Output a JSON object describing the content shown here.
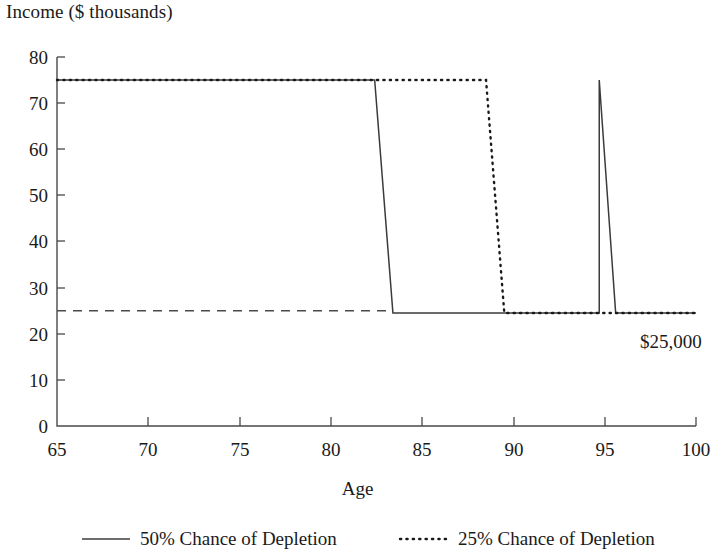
{
  "chart_data": {
    "type": "line",
    "title": "Income ($ thousands)",
    "xlabel": "Age",
    "ylabel": "Income ($ thousands)",
    "xlim": [
      65,
      100
    ],
    "ylim": [
      0,
      80
    ],
    "xticks": [
      "65",
      "70",
      "75",
      "80",
      "85",
      "90",
      "95",
      "100"
    ],
    "yticks": [
      "80",
      "70",
      "60",
      "50",
      "40",
      "30",
      "20",
      "10",
      "0"
    ],
    "grid": false,
    "legend_position": "bottom",
    "annotations": [
      {
        "text": "$25,000",
        "x": 99.5,
        "y": 21.5
      }
    ],
    "series": [
      {
        "name": "50% Chance of Depletion",
        "style": "solid",
        "color": "#3b3b3b",
        "points": [
          {
            "x": 65.0,
            "y": 75
          },
          {
            "x": 82.4,
            "y": 75
          },
          {
            "x": 83.4,
            "y": 24.5
          },
          {
            "x": 94.7,
            "y": 24.5
          },
          {
            "x": 94.7,
            "y": 75
          },
          {
            "x": 95.6,
            "y": 24.5
          },
          {
            "x": 100.0,
            "y": 24.5
          }
        ],
        "description": "Income stays at $75k until age ~83, drops to $25k, then a second segment rises to $75k again until ~95.5 before dropping to $25k"
      },
      {
        "name": "25% Chance of Depletion",
        "style": "dotted",
        "color": "#1a1a1a",
        "points": [
          {
            "x": 65.0,
            "y": 75
          },
          {
            "x": 88.5,
            "y": 75
          },
          {
            "x": 89.5,
            "y": 24.5
          },
          {
            "x": 100.0,
            "y": 24.5
          }
        ],
        "description": "Income stays at $75k until age ~89, then drops to $25k"
      },
      {
        "name": "Baseline $25,000",
        "style": "dashed",
        "color": "#4a4a4a",
        "points": [
          {
            "x": 65.0,
            "y": 25
          },
          {
            "x": 83.4,
            "y": 25
          }
        ],
        "description": "Dashed guaranteed income floor at $25,000 from age 65"
      }
    ]
  },
  "legend": {
    "items": [
      {
        "label": "50% Chance of Depletion",
        "style": "solid"
      },
      {
        "label": "25% Chance of Depletion",
        "style": "dotted"
      }
    ]
  }
}
